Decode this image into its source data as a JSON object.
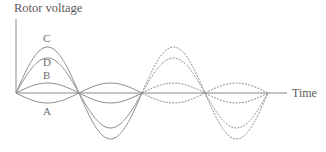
{
  "diagram": {
    "y_axis_label": "Rotor voltage",
    "x_axis_label": "Time",
    "curve_labels": {
      "A": "A",
      "B": "B",
      "C": "C",
      "D": "D"
    },
    "colors": {
      "axis": "#8a8a8a",
      "curve": "#8f8f8f",
      "text": "#5a5a5a"
    },
    "geometry": {
      "origin_x": 16,
      "baseline_y": 93,
      "half_period_px": 63,
      "x_axis_end": 287,
      "y_axis_top": 19
    },
    "curves": [
      {
        "name": "A",
        "amplitude": -10,
        "style_first_cycle": "solid",
        "style_second_cycle": "dashed"
      },
      {
        "name": "B",
        "amplitude": 10,
        "style_first_cycle": "solid",
        "style_second_cycle": "dashed"
      },
      {
        "name": "C",
        "amplitude": 46,
        "style_first_cycle": "solid",
        "style_second_cycle": "dashed"
      },
      {
        "name": "D",
        "amplitude": 35,
        "style_first_cycle": "solid",
        "style_second_cycle": "dashed"
      }
    ]
  }
}
